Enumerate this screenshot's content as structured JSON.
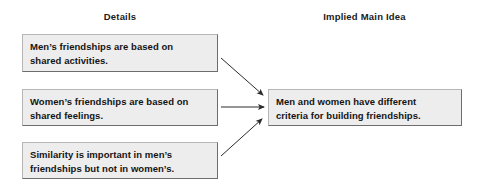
{
  "diagram": {
    "headers": {
      "left": "Details",
      "right": "Implied Main Idea"
    },
    "details": [
      {
        "id": "detail-1",
        "line1": "Men’s friendships are based on",
        "line2": "shared activities."
      },
      {
        "id": "detail-2",
        "line1": "Women’s friendships are based on",
        "line2": "shared feelings."
      },
      {
        "id": "detail-3",
        "line1": "Similarity is important in men’s",
        "line2": "friendships but not in women’s."
      }
    ],
    "main_idea": {
      "id": "main-idea",
      "line1": "Men and women have different",
      "line2": "criteria for building friendships."
    },
    "connectors": [
      {
        "id": "arrow-detail-1-to-main-idea",
        "from": "detail-1",
        "to": "main-idea",
        "direction": "down-right"
      },
      {
        "id": "arrow-detail-2-to-main-idea",
        "from": "detail-2",
        "to": "main-idea",
        "direction": "right"
      },
      {
        "id": "arrow-detail-3-to-main-idea",
        "from": "detail-3",
        "to": "main-idea",
        "direction": "up-right"
      }
    ],
    "colors": {
      "box_fill": "#eeeded",
      "box_border_light": "#b8b6b6",
      "box_border_dark": "#6e6c6c",
      "text": "#141414",
      "arrow": "#2b2b2b",
      "background": "#ffffff"
    }
  }
}
